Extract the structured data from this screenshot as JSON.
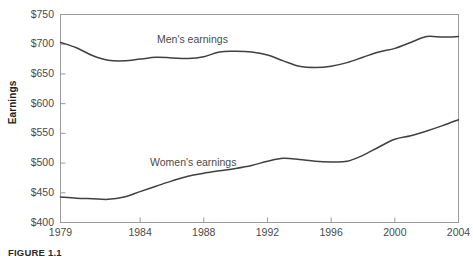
{
  "figure": {
    "caption": "FIGURE 1.1"
  },
  "chart_data": {
    "type": "line",
    "title": "",
    "xlabel": "",
    "ylabel": "Earnings",
    "xlim": [
      1979,
      2004
    ],
    "ylim": [
      400,
      750
    ],
    "grid": false,
    "legend_position": "inline-on-curves",
    "y_ticks": [
      400,
      450,
      500,
      550,
      600,
      650,
      700,
      750
    ],
    "y_tick_labels": [
      "$400",
      "$450",
      "$500",
      "$550",
      "$600",
      "$650",
      "$700",
      "$750"
    ],
    "x_ticks": [
      1979,
      1984,
      1988,
      1992,
      1996,
      2000,
      2004
    ],
    "x_tick_labels": [
      "1979",
      "1984",
      "1988",
      "1992",
      "1996",
      "2000",
      "2004"
    ],
    "x": [
      1979,
      1980,
      1981,
      1982,
      1983,
      1984,
      1985,
      1986,
      1987,
      1988,
      1989,
      1990,
      1991,
      1992,
      1993,
      1994,
      1995,
      1996,
      1997,
      1998,
      1999,
      2000,
      2001,
      2002,
      2003,
      2004
    ],
    "series": [
      {
        "name": "Men's earnings",
        "color": "#404040",
        "values": [
          703,
          694,
          681,
          673,
          672,
          675,
          678,
          677,
          676,
          679,
          687,
          688,
          687,
          682,
          672,
          663,
          661,
          663,
          669,
          678,
          687,
          693,
          703,
          713,
          712,
          713
        ]
      },
      {
        "name": "Women's earnings",
        "color": "#404040",
        "values": [
          443,
          441,
          440,
          439,
          443,
          452,
          461,
          470,
          478,
          483,
          487,
          491,
          496,
          503,
          508,
          506,
          503,
          502,
          503,
          513,
          527,
          540,
          546,
          554,
          563,
          573
        ]
      }
    ],
    "annotations": [
      {
        "text": "Men's earnings",
        "x": 1988,
        "y": 712
      },
      {
        "text": "Women's earnings",
        "x": 1987,
        "y": 523
      }
    ]
  },
  "axis_style": {
    "axis_color": "#9a9a9a",
    "line_color": "#404040",
    "text_color": "#4a4a4a"
  }
}
